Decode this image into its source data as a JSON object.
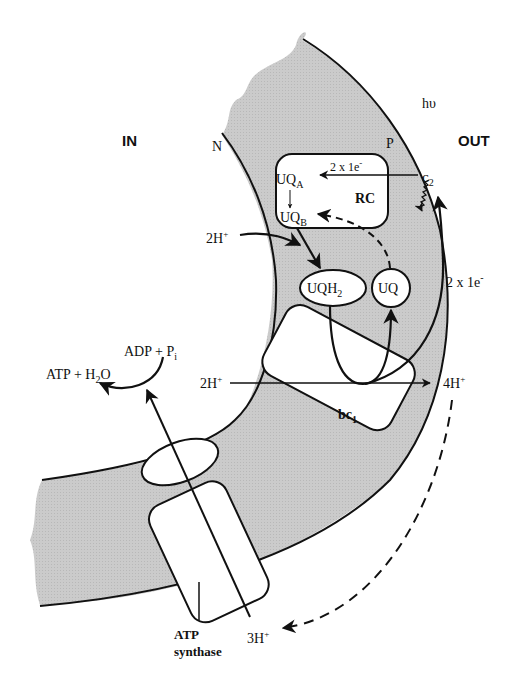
{
  "diagram": {
    "type": "bacterial photosynthetic membrane electron/proton transport",
    "regions": {
      "inside": "IN",
      "outside": "OUT",
      "negative_side": "N",
      "positive_side": "P"
    },
    "complexes": {
      "reaction_center": "RC",
      "cytochrome": "bc",
      "cytochrome_sub": "1",
      "atp_synthase_line1": "ATP",
      "atp_synthase_line2": "synthase"
    },
    "molecules": {
      "uqa": "UQ",
      "uqa_sub": "A",
      "uqb": "UQ",
      "uqb_sub": "B",
      "uqh2": "UQH",
      "uqh2_sub": "2",
      "uq": "UQ",
      "c2": "c",
      "c2_sub": "2",
      "light": "hυ"
    },
    "labels": {
      "electrons_rc": "2 x 1e",
      "electrons_rc_sup": "-",
      "electrons_return": "2 x 1e",
      "electrons_return_sup": "-",
      "protons_in_rc": "2H",
      "protons_in_bc1": "2H",
      "protons_out_bc1": "4H",
      "protons_atp": "3H",
      "plus": "+",
      "adp": "ADP + P",
      "adp_sub": "i",
      "atp": "ATP + H",
      "atp_sub": "2",
      "atp_end": "O"
    },
    "colors": {
      "membrane_fill": "#c9c9c9",
      "line": "#111111",
      "background": "#ffffff"
    }
  }
}
